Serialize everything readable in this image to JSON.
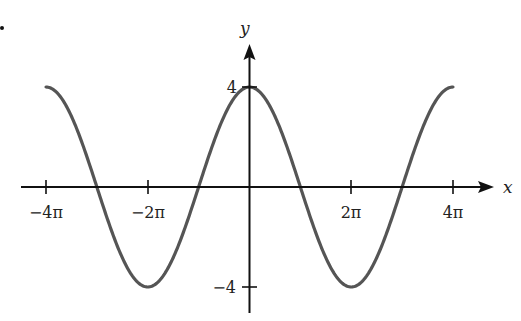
{
  "chart_data": {
    "type": "line",
    "title": "",
    "function": "y = 4cos(x/2)",
    "xlabel": "x",
    "ylabel": "y",
    "xlim": [
      -12.566,
      12.566
    ],
    "ylim": [
      -4,
      4
    ],
    "x_ticks": [
      {
        "value": -12.566,
        "label": "−4π"
      },
      {
        "value": -6.283,
        "label": "−2π"
      },
      {
        "value": 6.283,
        "label": "2π"
      },
      {
        "value": 12.566,
        "label": "4π"
      }
    ],
    "y_ticks": [
      {
        "value": 4,
        "label": "4"
      },
      {
        "value": -4,
        "label": "−4"
      }
    ],
    "grid": false,
    "legend": null,
    "series": [
      {
        "name": "4cos(x/2)",
        "color": "#555555",
        "x": [
          -12.566,
          -9.425,
          -6.283,
          -3.142,
          0,
          3.142,
          6.283,
          9.425,
          12.566
        ],
        "values": [
          4,
          0,
          -4,
          0,
          4,
          0,
          -4,
          0,
          4
        ]
      }
    ]
  },
  "colors": {
    "axis": "#111111",
    "curve": "#555555"
  }
}
